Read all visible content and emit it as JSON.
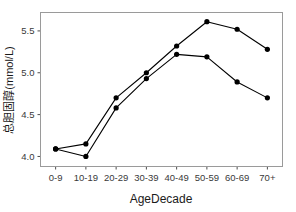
{
  "chart_data": {
    "type": "line",
    "title": "",
    "xlabel": "AgeDecade",
    "ylabel": "总胆固醇(mmol/L)",
    "categories": [
      "0-9",
      "10-19",
      "20-29",
      "30-39",
      "40-49",
      "50-59",
      "60-69",
      "70+"
    ],
    "series": [
      {
        "name": "series-1",
        "values": [
          4.09,
          4.15,
          4.7,
          5.0,
          5.32,
          5.61,
          5.52,
          5.28
        ]
      },
      {
        "name": "series-2",
        "values": [
          4.09,
          4.0,
          4.58,
          4.93,
          5.22,
          5.19,
          4.89,
          4.7
        ]
      }
    ],
    "ylim": [
      3.88,
      5.72
    ],
    "yticks": [
      4.0,
      4.5,
      5.0,
      5.5
    ],
    "ytick_labels": [
      "4.0",
      "4.5",
      "5.0",
      "5.5"
    ],
    "grid": false,
    "legend": "none",
    "marker": "filled-circle",
    "line_color": "#000000",
    "marker_color": "#000000",
    "panel_border_color": "#9a9a9a",
    "background_color": "#ffffff"
  },
  "axes": {
    "y_title": "总胆固醇(mmol/L)",
    "x_title": "AgeDecade"
  }
}
